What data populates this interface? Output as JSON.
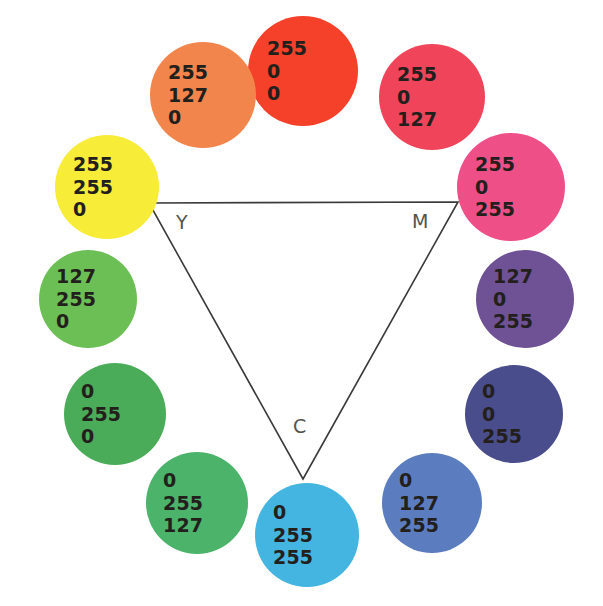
{
  "figure": {
    "background_color": "#ffffff",
    "text_color": "#231f1c",
    "vertex_label_color": "#55544c",
    "triangle_stroke_color": "#3a3a38"
  },
  "triangle": {
    "name": "cmy-triangle",
    "vertices": [
      {
        "label": "Y",
        "name": "vertex-yellow",
        "x": 149,
        "y": 203,
        "label_x": 176,
        "label_y": 211
      },
      {
        "label": "M",
        "name": "vertex-magenta",
        "x": 458,
        "y": 202,
        "label_x": 412,
        "label_y": 210
      },
      {
        "label": "C",
        "name": "vertex-cyan",
        "x": 303,
        "y": 479,
        "label_x": 293,
        "label_y": 415
      }
    ]
  },
  "chart_data": {
    "type": "scatter",
    "xlabel": "",
    "ylabel": "",
    "legend": [],
    "categories": [
      "255 0 0",
      "255 0 127",
      "255 0 255",
      "127 0 255",
      "0 0 255",
      "0 127 255",
      "0 255 255",
      "0 255 127",
      "0 255 0",
      "127 255 0",
      "255 255 0",
      "255 127 0"
    ],
    "series": [
      {
        "name": "R",
        "values": [
          255,
          255,
          255,
          127,
          0,
          0,
          0,
          0,
          0,
          127,
          255,
          255
        ]
      },
      {
        "name": "G",
        "values": [
          0,
          0,
          0,
          0,
          0,
          127,
          255,
          255,
          255,
          255,
          255,
          127
        ]
      },
      {
        "name": "B",
        "values": [
          0,
          127,
          255,
          255,
          255,
          255,
          255,
          127,
          0,
          0,
          0,
          0
        ]
      }
    ]
  },
  "swatches": [
    {
      "name": "swatch-red",
      "r": "255",
      "g": "0",
      "b": "0",
      "fill": "#f5402a",
      "cx": 303,
      "cy": 71,
      "radius": 55
    },
    {
      "name": "swatch-rose",
      "r": "255",
      "g": "0",
      "b": "127",
      "fill": "#ef4459",
      "cx": 432,
      "cy": 97,
      "radius": 53
    },
    {
      "name": "swatch-magenta",
      "r": "255",
      "g": "0",
      "b": "255",
      "fill": "#ef4f87",
      "cx": 511,
      "cy": 187,
      "radius": 54
    },
    {
      "name": "swatch-violet",
      "r": "127",
      "g": "0",
      "b": "255",
      "fill": "#6f5195",
      "cx": 525,
      "cy": 299,
      "radius": 49
    },
    {
      "name": "swatch-blue",
      "r": "0",
      "g": "0",
      "b": "255",
      "fill": "#4a4d8c",
      "cx": 514,
      "cy": 414,
      "radius": 49
    },
    {
      "name": "swatch-azure",
      "r": "0",
      "g": "127",
      "b": "255",
      "fill": "#5b7dc0",
      "cx": 432,
      "cy": 503,
      "radius": 50
    },
    {
      "name": "swatch-cyan",
      "r": "0",
      "g": "255",
      "b": "255",
      "fill": "#44b4e0",
      "cx": 307,
      "cy": 535,
      "radius": 52
    },
    {
      "name": "swatch-spring-green",
      "r": "0",
      "g": "255",
      "b": "127",
      "fill": "#4bb36a",
      "cx": 197,
      "cy": 503,
      "radius": 51
    },
    {
      "name": "swatch-green",
      "r": "0",
      "g": "255",
      "b": "0",
      "fill": "#4aac58",
      "cx": 115,
      "cy": 414,
      "radius": 51
    },
    {
      "name": "swatch-chartreuse",
      "r": "127",
      "g": "255",
      "b": "0",
      "fill": "#6cbf55",
      "cx": 88,
      "cy": 299,
      "radius": 49
    },
    {
      "name": "swatch-yellow",
      "r": "255",
      "g": "255",
      "b": "0",
      "fill": "#f7ec37",
      "cx": 107,
      "cy": 187,
      "radius": 52
    },
    {
      "name": "swatch-orange",
      "r": "255",
      "g": "127",
      "b": "0",
      "fill": "#f2854c",
      "cx": 203,
      "cy": 95,
      "radius": 53
    }
  ]
}
